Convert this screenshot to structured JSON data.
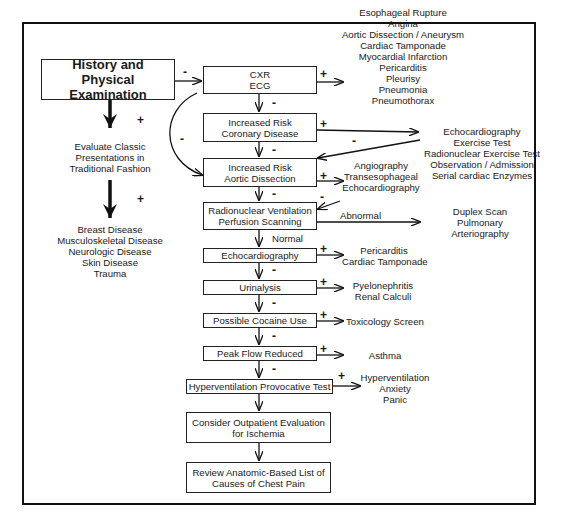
{
  "diagram": {
    "type": "flowchart",
    "start": {
      "line1": "History and",
      "line2": "Physical Examination"
    },
    "left_branch": {
      "sign1": "+",
      "classic": [
        "Evaluate Classic",
        "Presentations in",
        "Traditional Fashion"
      ],
      "sign2": "+",
      "conditions": [
        "Breast Disease",
        "Musculoskeletal Disease",
        "Neurologic Disease",
        "Skin Disease",
        "Trauma"
      ]
    },
    "main_steps": [
      {
        "id": "cxr",
        "lines": [
          "CXR",
          "ECG"
        ]
      },
      {
        "id": "coronary",
        "lines": [
          "Increased Risk",
          "Coronary Disease"
        ]
      },
      {
        "id": "aortic",
        "lines": [
          "Increased Risk",
          "Aortic Dissection"
        ]
      },
      {
        "id": "radionuclear",
        "lines": [
          "Radionuclear Ventilation",
          "Perfusion Scanning"
        ]
      },
      {
        "id": "echo",
        "lines": [
          "Echocardiography"
        ]
      },
      {
        "id": "urinalysis",
        "lines": [
          "Urinalysis"
        ]
      },
      {
        "id": "cocaine",
        "lines": [
          "Possible Cocaine Use"
        ]
      },
      {
        "id": "peakflow",
        "lines": [
          "Peak Flow Reduced"
        ]
      },
      {
        "id": "hypervent",
        "lines": [
          "Hyperventilation Provocative Test"
        ]
      },
      {
        "id": "outpatient",
        "lines": [
          "Consider Outpatient Evaluation",
          "for Ischemia"
        ]
      },
      {
        "id": "review",
        "lines": [
          "Review Anatomic-Based List of",
          "Causes of Chest Pain"
        ]
      }
    ],
    "outcomes": {
      "cxr": [
        "Esophageal Rupture",
        "Angina",
        "Aortic Dissection / Aneurysm",
        "Cardiac Tamponade",
        "Myocardial Infarction",
        "Pericarditis",
        "Pleurisy",
        "Pneumonia",
        "Pneumothorax"
      ],
      "coronary": [
        "Echocardiography",
        "Exercise Test",
        "Radionuclear Exercise Test",
        "Observation / Admission",
        "Serial cardiac Enzymes"
      ],
      "aortic": [
        "Angiography",
        "Transesophageal",
        "Echocardiography"
      ],
      "radionuclear": [
        "Duplex Scan",
        "Pulmonary",
        "Arteriography"
      ],
      "echo": [
        "Pericarditis",
        "Cardiac Tamponade"
      ],
      "urinalysis": [
        "Pyelonephritis",
        "Renal Calculi"
      ],
      "cocaine": [
        "Toxicology Screen"
      ],
      "peakflow": [
        "Asthma"
      ],
      "hypervent": [
        "Hyperventilation",
        "Anxiety",
        "Panic"
      ]
    },
    "edge_labels": {
      "plus": "+",
      "minus": "-",
      "abnormal": "Abnormal",
      "normal": "Normal"
    }
  }
}
